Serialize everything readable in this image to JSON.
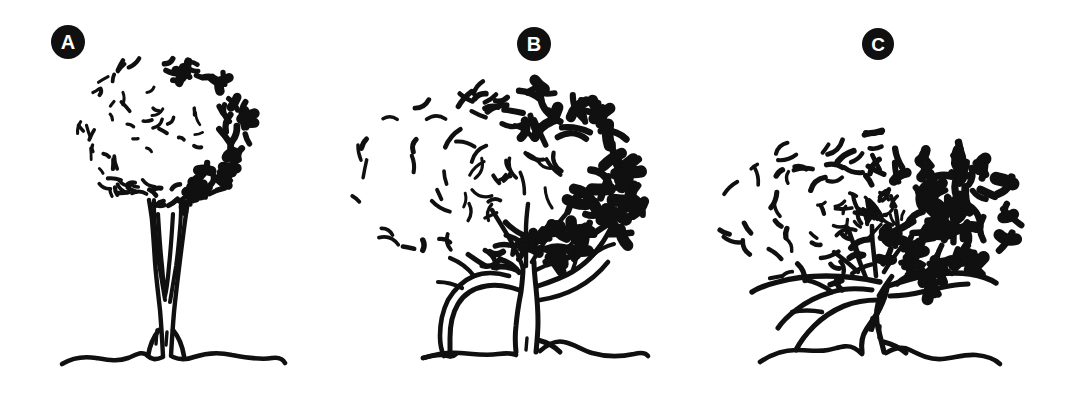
{
  "figure": {
    "title": "Three tree growth forms",
    "background_color": "#ffffff",
    "ink_color": "#101010",
    "label_text_color": "#ffffff",
    "width": 1067,
    "height": 393,
    "style": "hand-drawn black ink line illustration"
  },
  "panels": [
    {
      "id": "a",
      "label": "A",
      "label_center": {
        "x": 68,
        "y": 42
      },
      "label_radius": 17,
      "form_name": "upright round-crowned tree",
      "canopy": {
        "shape": "round",
        "center_x": 163,
        "center_y": 132,
        "radius_x": 83,
        "radius_y": 76,
        "shading_side": "right",
        "stroke_count": 150
      },
      "trunk": {
        "description": "tall straight trunk splitting into vertical branches with a narrow V fork",
        "base_x": 163,
        "base_y": 356,
        "top_y": 196,
        "branch_count": 4
      },
      "ground": {
        "y": 356,
        "x_start": 62,
        "x_end": 285
      }
    },
    {
      "id": "b",
      "label": "B",
      "label_center": {
        "x": 534,
        "y": 44
      },
      "label_radius": 17,
      "form_name": "spreading open-branched tree",
      "canopy": {
        "shape": "broad oval",
        "center_x": 497,
        "center_y": 180,
        "radius_x": 147,
        "radius_y": 93,
        "shading_side": "right",
        "stroke_count": 130
      },
      "trunk": {
        "description": "short trunk dividing low into several spreading limbs",
        "base_x": 523,
        "base_y": 352,
        "top_y": 262,
        "branch_count": 5
      },
      "ground": {
        "y": 352,
        "x_start": 423,
        "x_end": 648
      }
    },
    {
      "id": "c",
      "label": "C",
      "label_center": {
        "x": 878,
        "y": 44
      },
      "label_radius": 16,
      "form_name": "broad low-branching spreading tree",
      "canopy": {
        "shape": "wide flattened dome",
        "center_x": 868,
        "center_y": 213,
        "radius_x": 145,
        "radius_y": 82,
        "shading_side": "right",
        "stroke_count": 170
      },
      "trunk": {
        "description": "very short gnarled trunk with wide horizontal low limbs",
        "base_x": 875,
        "base_y": 352,
        "top_y": 285,
        "branch_count": 6
      },
      "ground": {
        "y": 352,
        "x_start": 760,
        "x_end": 1000
      }
    }
  ]
}
